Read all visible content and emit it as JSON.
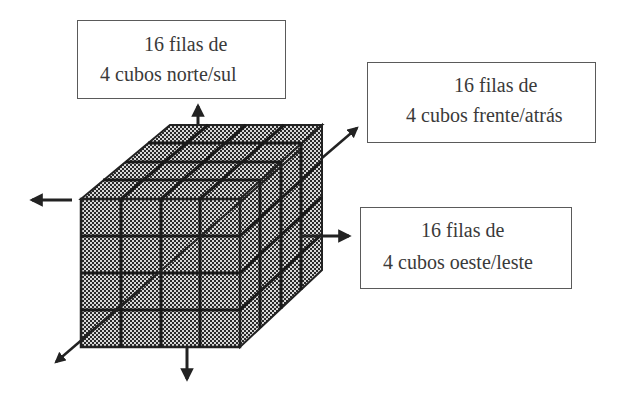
{
  "diagram": {
    "type": "cube-axes-illustration",
    "cube": {
      "divisions_per_edge": 4,
      "pattern": "checkered-halftone",
      "fill_color": "#7a7a7a",
      "line_color": "#222222"
    },
    "labels": [
      {
        "id": "north-south",
        "line1": "16 filas de",
        "line2": "4 cubos norte/sul"
      },
      {
        "id": "front-back",
        "line1": "16 filas de",
        "line2": "4 cubos frente/atrás"
      },
      {
        "id": "west-east",
        "line1": "16 filas de",
        "line2": "4 cubos oeste/leste"
      }
    ],
    "arrows": [
      {
        "name": "up-arrow",
        "axis": "norte/sul"
      },
      {
        "name": "down-arrow",
        "axis": "norte/sul"
      },
      {
        "name": "left-arrow",
        "axis": "oeste/leste"
      },
      {
        "name": "right-arrow",
        "axis": "oeste/leste"
      },
      {
        "name": "diagonal-front-arrow",
        "axis": "frente/atrás"
      },
      {
        "name": "diagonal-back-arrow",
        "axis": "frente/atrás"
      }
    ]
  }
}
